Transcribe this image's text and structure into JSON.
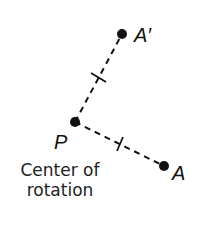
{
  "diagram": {
    "points": {
      "A_prime": {
        "label": "A′",
        "x": 122,
        "y": 34
      },
      "P": {
        "label": "P",
        "x": 75,
        "y": 122
      },
      "A": {
        "label": "A",
        "x": 164,
        "y": 166
      }
    },
    "segments": [
      {
        "from": "P",
        "to": "A_prime",
        "style": "dashed",
        "tick_marks": 1
      },
      {
        "from": "P",
        "to": "A",
        "style": "dashed",
        "tick_marks": 1
      }
    ],
    "caption": {
      "line1": "Center of",
      "line2": "rotation"
    },
    "colors": {
      "ink": "#111111",
      "background": "#ffffff"
    }
  }
}
